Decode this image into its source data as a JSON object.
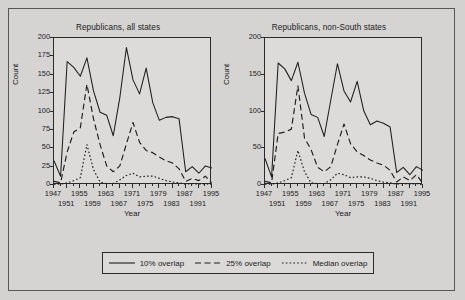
{
  "figure": {
    "xlabel": "Year",
    "ylabel": "Count"
  },
  "legend": {
    "items": [
      {
        "label": "10% overlap",
        "style": "solid"
      },
      {
        "label": "25% overlap",
        "style": "dashed"
      },
      {
        "label": "Median overlap",
        "style": "dotted"
      }
    ]
  },
  "chart_data": [
    {
      "type": "line",
      "title": "Republicans, all states",
      "xlabel": "Year",
      "ylabel": "Count",
      "xlim": [
        1947,
        1995
      ],
      "ylim": [
        0,
        200
      ],
      "grid": false,
      "legend_position": "bottom",
      "xticks": [
        1947,
        1951,
        1955,
        1959,
        1963,
        1967,
        1971,
        1975,
        1979,
        1983,
        1987,
        1991,
        1995
      ],
      "xtick_labels_top": [
        "1947",
        "1955",
        "1963",
        "1971",
        "1979",
        "1987",
        "1995"
      ],
      "xtick_labels_bottom": [
        "1951",
        "1959",
        "1967",
        "1975",
        "1983",
        "1991"
      ],
      "yticks": [
        0,
        25,
        50,
        75,
        100,
        125,
        150,
        175,
        200
      ],
      "x": [
        1947,
        1949,
        1951,
        1953,
        1955,
        1957,
        1959,
        1961,
        1963,
        1965,
        1967,
        1969,
        1971,
        1973,
        1975,
        1977,
        1979,
        1981,
        1983,
        1985,
        1987,
        1989,
        1991,
        1993,
        1995
      ],
      "series": [
        {
          "name": "10% overlap",
          "style": "solid",
          "values": [
            33,
            12,
            168,
            160,
            148,
            173,
            128,
            99,
            95,
            67,
            119,
            187,
            143,
            124,
            159,
            112,
            88,
            92,
            93,
            90,
            18,
            25,
            16,
            26,
            23
          ]
        },
        {
          "name": "25% overlap",
          "style": "dashed",
          "values": [
            5,
            3,
            45,
            72,
            78,
            137,
            90,
            55,
            26,
            18,
            26,
            56,
            85,
            58,
            47,
            44,
            38,
            33,
            30,
            22,
            5,
            9,
            6,
            12,
            2
          ]
        },
        {
          "name": "Median overlap",
          "style": "dotted",
          "values": [
            1,
            1,
            3,
            6,
            10,
            55,
            21,
            4,
            2,
            2,
            7,
            13,
            16,
            11,
            12,
            12,
            9,
            6,
            4,
            3,
            1,
            2,
            1,
            2,
            0
          ]
        }
      ]
    },
    {
      "type": "line",
      "title": "Republicans, non-South states",
      "xlabel": "Year",
      "ylabel": "Count",
      "xlim": [
        1947,
        1995
      ],
      "ylim": [
        0,
        200
      ],
      "grid": false,
      "legend_position": "bottom",
      "xticks": [
        1947,
        1951,
        1955,
        1959,
        1963,
        1967,
        1971,
        1975,
        1979,
        1983,
        1987,
        1991,
        1995
      ],
      "xtick_labels_top": [
        "1947",
        "1955",
        "1963",
        "1971",
        "1979",
        "1987",
        "1995"
      ],
      "xtick_labels_bottom": [
        "1951",
        "1959",
        "1967",
        "1975",
        "1983",
        "1991"
      ],
      "yticks": [
        0,
        50,
        100,
        150,
        200
      ],
      "x": [
        1947,
        1949,
        1951,
        1953,
        1955,
        1957,
        1959,
        1961,
        1963,
        1965,
        1967,
        1969,
        1971,
        1973,
        1975,
        1977,
        1979,
        1981,
        1983,
        1985,
        1987,
        1989,
        1991,
        1993,
        1995
      ],
      "series": [
        {
          "name": "10% overlap",
          "style": "solid",
          "values": [
            36,
            11,
            166,
            158,
            142,
            167,
            125,
            96,
            92,
            66,
            116,
            165,
            128,
            113,
            141,
            101,
            82,
            87,
            84,
            79,
            17,
            24,
            14,
            25,
            20
          ]
        },
        {
          "name": "25% overlap",
          "style": "dashed",
          "values": [
            5,
            3,
            70,
            72,
            76,
            135,
            64,
            48,
            24,
            18,
            25,
            55,
            83,
            56,
            45,
            40,
            34,
            30,
            27,
            20,
            4,
            11,
            6,
            14,
            2
          ]
        },
        {
          "name": "Median overlap",
          "style": "dotted",
          "values": [
            1,
            1,
            3,
            6,
            10,
            47,
            18,
            3,
            2,
            2,
            7,
            16,
            14,
            10,
            11,
            11,
            9,
            6,
            4,
            3,
            1,
            2,
            1,
            2,
            0
          ]
        }
      ]
    }
  ]
}
